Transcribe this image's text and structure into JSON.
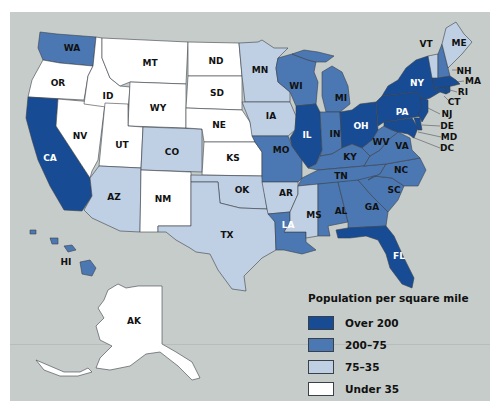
{
  "map": {
    "title": "Population per square mile",
    "colors": {
      "over_200": "#174c94",
      "200_75": "#4b78b2",
      "75_35": "#bfcfe4",
      "under_35": "#ffffff",
      "water": "#c6ccc9",
      "border": "#3a3f48"
    },
    "legend": [
      {
        "label": "Over 200",
        "color": "#174c94"
      },
      {
        "label": "200–75",
        "color": "#4b78b2"
      },
      {
        "label": "75–35",
        "color": "#bfcfe4"
      },
      {
        "label": "Under 35",
        "color": "#ffffff"
      }
    ],
    "states": {
      "WA": {
        "label": "WA",
        "category": "200–75"
      },
      "OR": {
        "label": "OR",
        "category": "Under 35"
      },
      "CA": {
        "label": "CA",
        "category": "Over 200"
      },
      "NV": {
        "label": "NV",
        "category": "Under 35"
      },
      "ID": {
        "label": "ID",
        "category": "Under 35"
      },
      "MT": {
        "label": "MT",
        "category": "Under 35"
      },
      "WY": {
        "label": "WY",
        "category": "Under 35"
      },
      "UT": {
        "label": "UT",
        "category": "Under 35"
      },
      "AZ": {
        "label": "AZ",
        "category": "75–35"
      },
      "CO": {
        "label": "CO",
        "category": "75–35"
      },
      "NM": {
        "label": "NM",
        "category": "Under 35"
      },
      "ND": {
        "label": "ND",
        "category": "Under 35"
      },
      "SD": {
        "label": "SD",
        "category": "Under 35"
      },
      "NE": {
        "label": "NE",
        "category": "Under 35"
      },
      "KS": {
        "label": "KS",
        "category": "Under 35"
      },
      "OK": {
        "label": "OK",
        "category": "75–35"
      },
      "TX": {
        "label": "TX",
        "category": "75–35"
      },
      "MN": {
        "label": "MN",
        "category": "75–35"
      },
      "IA": {
        "label": "IA",
        "category": "75–35"
      },
      "MO": {
        "label": "MO",
        "category": "200–75"
      },
      "AR": {
        "label": "AR",
        "category": "75–35"
      },
      "LA": {
        "label": "LA",
        "category": "200–75"
      },
      "WI": {
        "label": "WI",
        "category": "200–75"
      },
      "IL": {
        "label": "IL",
        "category": "Over 200"
      },
      "MI": {
        "label": "MI",
        "category": "200–75"
      },
      "IN": {
        "label": "IN",
        "category": "200–75"
      },
      "OH": {
        "label": "OH",
        "category": "Over 200"
      },
      "KY": {
        "label": "KY",
        "category": "200–75"
      },
      "TN": {
        "label": "TN",
        "category": "200–75"
      },
      "MS": {
        "label": "MS",
        "category": "75–35"
      },
      "AL": {
        "label": "AL",
        "category": "200–75"
      },
      "GA": {
        "label": "GA",
        "category": "200–75"
      },
      "FL": {
        "label": "FL",
        "category": "Over 200"
      },
      "SC": {
        "label": "SC",
        "category": "200–75"
      },
      "NC": {
        "label": "NC",
        "category": "200–75"
      },
      "VA": {
        "label": "VA",
        "category": "200–75"
      },
      "WV": {
        "label": "WV",
        "category": "200–75"
      },
      "PA": {
        "label": "PA",
        "category": "Over 200"
      },
      "NY": {
        "label": "NY",
        "category": "Over 200"
      },
      "VT": {
        "label": "VT",
        "category": "75–35"
      },
      "NH": {
        "label": "NH",
        "category": "200–75"
      },
      "ME": {
        "label": "ME",
        "category": "75–35"
      },
      "MA": {
        "label": "MA",
        "category": "Over 200"
      },
      "RI": {
        "label": "RI",
        "category": "Over 200"
      },
      "CT": {
        "label": "CT",
        "category": "Over 200"
      },
      "NJ": {
        "label": "NJ",
        "category": "Over 200"
      },
      "DE": {
        "label": "DE",
        "category": "Over 200"
      },
      "MD": {
        "label": "MD",
        "category": "Over 200"
      },
      "DC": {
        "label": "DC",
        "category": "Over 200"
      },
      "HI": {
        "label": "HI",
        "category": "200–75"
      },
      "AK": {
        "label": "AK",
        "category": "Under 35"
      }
    }
  }
}
